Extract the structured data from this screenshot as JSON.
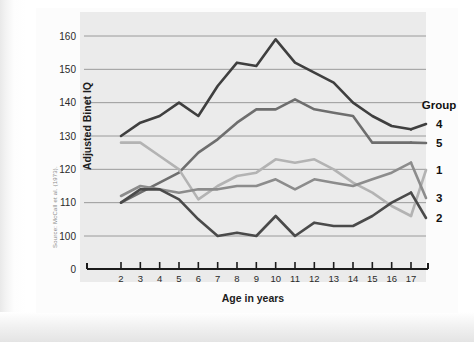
{
  "source_credit": "Source: McCall et al. (1973).",
  "legend": {
    "title": "Group",
    "items": [
      {
        "label": "4",
        "color": "#3f3f3f"
      },
      {
        "label": "5",
        "color": "#6e6e6e"
      },
      {
        "label": "1",
        "color": "#b3b3b3"
      },
      {
        "label": "3",
        "color": "#8c8c8c"
      },
      {
        "label": "2",
        "color": "#4a4a4a"
      }
    ]
  },
  "chart_data": {
    "type": "line",
    "title": "",
    "xlabel": "Age in years",
    "ylabel": "Adjusted Binet IQ",
    "xlim": [
      2,
      17
    ],
    "ylim": [
      95,
      165
    ],
    "grid": true,
    "legend_position": "right",
    "x": [
      2,
      3,
      4,
      5,
      6,
      7,
      8,
      9,
      10,
      11,
      12,
      13,
      14,
      15,
      16,
      17
    ],
    "yticks": [
      0,
      100,
      110,
      120,
      130,
      140,
      150,
      160
    ],
    "xticks": [
      2,
      3,
      4,
      5,
      6,
      7,
      8,
      9,
      10,
      11,
      12,
      13,
      14,
      15,
      16,
      17
    ],
    "series": [
      {
        "name": "4",
        "color": "#3f3f3f",
        "values": [
          130,
          134,
          136,
          140,
          136,
          145,
          152,
          151,
          159,
          152,
          149,
          146,
          140,
          136,
          133,
          132
        ]
      },
      {
        "name": "5",
        "color": "#6e6e6e",
        "values": [
          110,
          113,
          116,
          119,
          125,
          129,
          134,
          138,
          138,
          141,
          138,
          137,
          136,
          128,
          128,
          128
        ]
      },
      {
        "name": "1",
        "color": "#b3b3b3",
        "values": [
          128,
          128,
          124,
          120,
          111,
          115,
          118,
          119,
          123,
          122,
          123,
          120,
          116,
          113,
          109,
          106
        ]
      },
      {
        "name": "3",
        "color": "#8c8c8c",
        "values": [
          112,
          115,
          114,
          113,
          114,
          114,
          115,
          115,
          117,
          114,
          117,
          116,
          115,
          117,
          119,
          122
        ]
      },
      {
        "name": "2",
        "color": "#4a4a4a",
        "values": [
          110,
          114,
          114,
          111,
          105,
          100,
          101,
          100,
          106,
          100,
          104,
          103,
          103,
          106,
          110,
          113
        ]
      }
    ]
  }
}
